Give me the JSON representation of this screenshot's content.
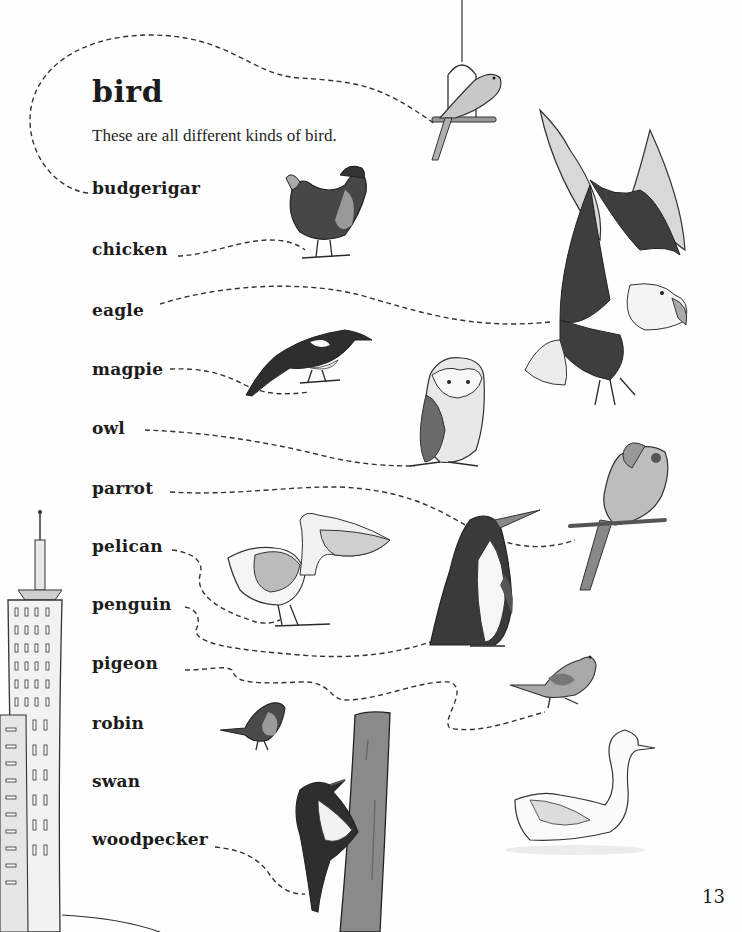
{
  "page": {
    "title": "bird",
    "subtitle": "These are all different kinds of bird.",
    "page_number": "13"
  },
  "words": [
    {
      "label": "budgerigar",
      "illustration": "budgerigar-on-swing"
    },
    {
      "label": "chicken",
      "illustration": "chicken"
    },
    {
      "label": "eagle",
      "illustration": "eagle"
    },
    {
      "label": "magpie",
      "illustration": "magpie"
    },
    {
      "label": "owl",
      "illustration": "owl"
    },
    {
      "label": "parrot",
      "illustration": "parrot"
    },
    {
      "label": "pelican",
      "illustration": "pelican"
    },
    {
      "label": "penguin",
      "illustration": "penguin"
    },
    {
      "label": "pigeon",
      "illustration": "pigeon"
    },
    {
      "label": "robin",
      "illustration": "robin"
    },
    {
      "label": "swan",
      "illustration": "swan"
    },
    {
      "label": "woodpecker",
      "illustration": "woodpecker"
    }
  ],
  "scenery": [
    "skyscraper",
    "wooden-post"
  ],
  "colors": {
    "background": "#fefefe",
    "text": "#1c1c1c",
    "dashed_line": "#333333",
    "dark_plumage": "#4a4a4a",
    "mid_grey": "#9a9a9a",
    "light_grey": "#cfcfcf"
  }
}
